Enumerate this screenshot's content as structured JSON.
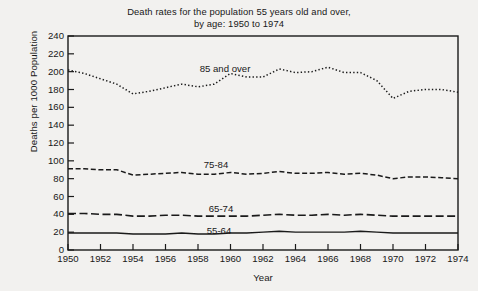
{
  "figure": {
    "title": "Death rates for the population 55 years old and over,\nby age: 1950 to 1974",
    "ylabel": "Deaths per 1000 Population",
    "xlabel": "Year"
  },
  "labels": {
    "series_85": "85 and over",
    "series_75": "75-84",
    "series_65": "65-74",
    "series_55": "55-64"
  },
  "chart_data": {
    "type": "line",
    "title": "Death rates for the population 55 years old and over, by age: 1950 to 1974",
    "xlabel": "Year",
    "ylabel": "Deaths per 1000 Population",
    "xlim": [
      1950,
      1974
    ],
    "ylim": [
      0,
      240
    ],
    "ytick_labels": [
      "0",
      "20",
      "40",
      "60",
      "80",
      "100",
      "120",
      "140",
      "160",
      "180",
      "200",
      "220",
      "240"
    ],
    "ytick_values": [
      0,
      20,
      40,
      60,
      80,
      100,
      120,
      140,
      160,
      180,
      200,
      220,
      240
    ],
    "xtick_labels": [
      "1950",
      "1952",
      "1954",
      "1956",
      "1958",
      "1960",
      "1962",
      "1964",
      "1966",
      "1968",
      "1970",
      "1972",
      "1974"
    ],
    "xtick_values": [
      1950,
      1952,
      1954,
      1956,
      1958,
      1960,
      1962,
      1964,
      1966,
      1968,
      1970,
      1972,
      1974
    ],
    "grid": false,
    "legend_position": "inline-annotations",
    "x": [
      1950,
      1951,
      1952,
      1953,
      1954,
      1955,
      1956,
      1957,
      1958,
      1959,
      1960,
      1961,
      1962,
      1963,
      1964,
      1965,
      1966,
      1967,
      1968,
      1969,
      1970,
      1971,
      1972,
      1973,
      1974
    ],
    "series": [
      {
        "name": "85 and over",
        "line_style": "dotted",
        "values": [
          202,
          198,
          192,
          186,
          175,
          178,
          182,
          186,
          183,
          186,
          198,
          194,
          194,
          203,
          199,
          200,
          205,
          199,
          199,
          190,
          170,
          178,
          180,
          180,
          177
        ]
      },
      {
        "name": "75-84",
        "line_style": "dashed",
        "values": [
          91,
          91,
          90,
          90,
          84,
          85,
          86,
          87,
          85,
          85,
          87,
          85,
          86,
          88,
          86,
          86,
          87,
          85,
          86,
          84,
          80,
          82,
          82,
          81,
          80
        ]
      },
      {
        "name": "65-74",
        "line_style": "long-dash",
        "values": [
          41,
          41,
          40,
          40,
          38,
          38,
          39,
          39,
          38,
          38,
          38,
          38,
          39,
          40,
          39,
          39,
          40,
          39,
          40,
          39,
          38,
          38,
          38,
          38,
          38
        ]
      },
      {
        "name": "55-64",
        "line_style": "solid",
        "values": [
          19,
          19,
          19,
          19,
          18,
          18,
          18,
          19,
          18,
          18,
          19,
          19,
          20,
          21,
          20,
          20,
          20,
          20,
          21,
          20,
          19,
          19,
          19,
          19,
          19
        ]
      }
    ]
  }
}
